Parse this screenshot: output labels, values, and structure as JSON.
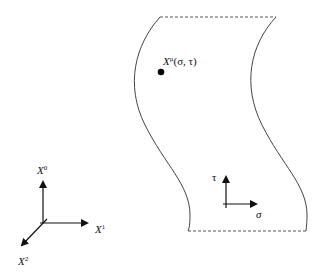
{
  "diagram": {
    "point_label": {
      "base": "X",
      "sup": "μ",
      "args": "(σ, τ)"
    },
    "worldsheet_axes": {
      "vertical": "τ",
      "horizontal": "σ"
    },
    "spacetime_axes": [
      {
        "base": "X",
        "sup": "0"
      },
      {
        "base": "X",
        "sup": "1"
      },
      {
        "base": "X",
        "sup": "2"
      }
    ],
    "colors": {
      "line": "#444444",
      "point": "#000000",
      "text": "#111111"
    }
  }
}
